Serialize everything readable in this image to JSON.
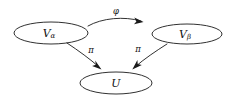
{
  "diagram": {
    "type": "commutative-diagram",
    "background_color": "#ffffff",
    "stroke_color": "#1a1a1a",
    "text_color": "#111111",
    "nodes": [
      {
        "id": "v-alpha",
        "name": "node-v-alpha",
        "base": "V",
        "subscript": "α",
        "full_label": "Vα",
        "shape": "ellipse",
        "cx": 51,
        "cy": 33,
        "rx": 37,
        "ry": 11
      },
      {
        "id": "v-beta",
        "name": "node-v-beta",
        "base": "V",
        "subscript": "β",
        "full_label": "Vβ",
        "shape": "ellipse",
        "cx": 187,
        "cy": 34,
        "rx": 35,
        "ry": 10
      },
      {
        "id": "u",
        "name": "node-u",
        "base": "U",
        "subscript": "",
        "full_label": "U",
        "shape": "ellipse",
        "cx": 116,
        "cy": 83,
        "rx": 36,
        "ry": 11
      }
    ],
    "edges": [
      {
        "id": "phi",
        "name": "edge-phi",
        "label": "φ",
        "from": "v-alpha",
        "to": "v-beta",
        "style": "curved-arc",
        "label_x": 116,
        "label_y": 11
      },
      {
        "id": "pi-left",
        "name": "edge-pi-left",
        "label": "π",
        "from": "v-alpha",
        "to": "u",
        "style": "curved-down-right",
        "label_x": 91,
        "label_y": 50
      },
      {
        "id": "pi-right",
        "name": "edge-pi-right",
        "label": "π",
        "from": "v-beta",
        "to": "u",
        "style": "curved-down-left",
        "label_x": 138,
        "label_y": 49
      }
    ]
  }
}
